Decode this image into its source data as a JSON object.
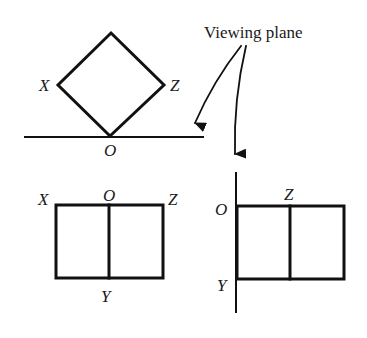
{
  "caption": {
    "viewing_plane": "Viewing plane"
  },
  "top_view": {
    "labels": {
      "x": "X",
      "z": "Z",
      "o": "O"
    }
  },
  "front_view": {
    "labels": {
      "x": "X",
      "o": "O",
      "z": "Z",
      "y": "Y"
    }
  },
  "side_view": {
    "labels": {
      "o": "O",
      "z": "Z",
      "y": "Y"
    }
  },
  "colors": {
    "ink": "#111111",
    "background": "#ffffff"
  }
}
